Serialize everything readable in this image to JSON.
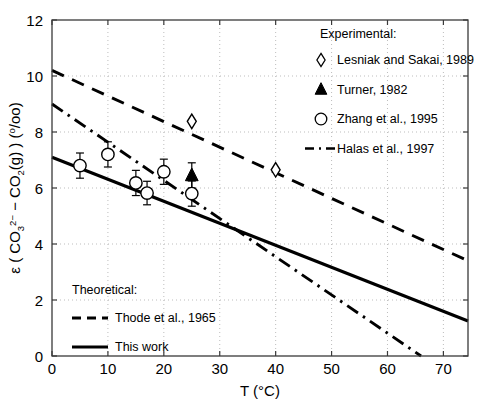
{
  "chart_data": {
    "type": "scatter",
    "title": "",
    "xlabel": "T (°C)",
    "ylabel": "ε ( CO3 2− − CO2(g) ) (°/oo)",
    "ylabel_parts": {
      "epsilon": "ε",
      "open_paren": " ( CO",
      "sub1": "3",
      "sup1": "2−",
      "middle": " − CO",
      "sub2": "2",
      "gas": "(g) ) (",
      "permil_sup": "o",
      "permil_rest": "/oo)"
    },
    "xlim": [
      0,
      74.4
    ],
    "ylim": [
      0,
      12
    ],
    "xticks": [
      0,
      10,
      20,
      30,
      40,
      50,
      60,
      70
    ],
    "yticks": [
      0,
      2,
      4,
      6,
      8,
      10,
      12
    ],
    "grid": true,
    "grid_style": "dotted",
    "series": [
      {
        "name": "Lesniak and Sakai, 1989",
        "marker": "diamond-open",
        "type": "scatter",
        "points": [
          {
            "x": 25,
            "y": 8.38
          },
          {
            "x": 40,
            "y": 6.65
          }
        ]
      },
      {
        "name": "Turner, 1982",
        "marker": "triangle-filled",
        "type": "scatter",
        "points": [
          {
            "x": 25,
            "y": 6.45,
            "yerr": 0.45
          }
        ]
      },
      {
        "name": "Zhang et al., 1995",
        "marker": "circle-open",
        "type": "scatter",
        "points": [
          {
            "x": 5,
            "y": 6.8,
            "yerr": 0.45
          },
          {
            "x": 10,
            "y": 7.2,
            "yerr": 0.45
          },
          {
            "x": 15,
            "y": 6.18,
            "yerr": 0.45
          },
          {
            "x": 17,
            "y": 5.82,
            "yerr": 0.42
          },
          {
            "x": 20,
            "y": 6.58,
            "yerr": 0.45
          },
          {
            "x": 25,
            "y": 5.8,
            "yerr": 0.45
          }
        ]
      },
      {
        "name": "Halas et al., 1997",
        "marker": "none",
        "type": "line",
        "linestyle": "dashdot",
        "points": [
          {
            "x": 0,
            "y": 9.0
          },
          {
            "x": 66,
            "y": 0.0
          }
        ]
      },
      {
        "name": "Thode et al., 1965",
        "marker": "none",
        "type": "line",
        "linestyle": "dashed",
        "points": [
          {
            "x": 0,
            "y": 10.2
          },
          {
            "x": 74.4,
            "y": 3.4
          }
        ]
      },
      {
        "name": "This work",
        "marker": "none",
        "type": "line",
        "linestyle": "solid",
        "points": [
          {
            "x": 0,
            "y": 7.1
          },
          {
            "x": 74.4,
            "y": 1.25
          }
        ]
      }
    ],
    "legends": [
      {
        "position": "top-right",
        "heading": "Experimental:",
        "entries": [
          {
            "label": "Lesniak and Sakai, 1989",
            "symbol": "diamond-open"
          },
          {
            "label": "Turner, 1982",
            "symbol": "triangle-filled"
          },
          {
            "label": "Zhang et al., 1995",
            "symbol": "circle-open"
          },
          {
            "label": "Halas et al., 1997",
            "symbol": "dashdot-line"
          }
        ]
      },
      {
        "position": "bottom-left",
        "heading": "Theoretical:",
        "entries": [
          {
            "label": "Thode et al., 1965",
            "symbol": "dashed-line"
          },
          {
            "label": "This work",
            "symbol": "solid-line"
          }
        ]
      }
    ],
    "colors": {
      "line": "#000000",
      "grid": "#b5b5b5",
      "axis": "#3a3a3a",
      "background": "#ffffff"
    }
  }
}
